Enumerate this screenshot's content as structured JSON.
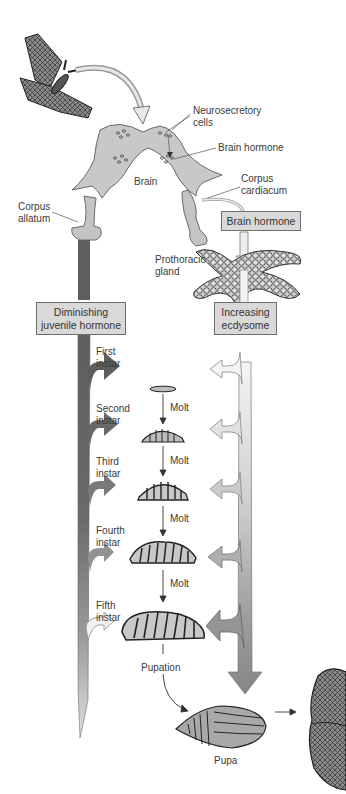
{
  "diagram": {
    "labels": {
      "neurosecretory_cells": "Neurosecretory\ncells",
      "brain_hormone": "Brain hormone",
      "brain": "Brain",
      "corpus_cardiacum": "Corpus\ncardiacum",
      "corpus_allatum": "Corpus\nallatum",
      "prothoracic_gland": "Prothoracic\ngland",
      "pupation": "Pupation",
      "pupa": "Pupa"
    },
    "boxes": {
      "brain_hormone_box": "Brain hormone",
      "juvenile_hormone_box": "Diminishing\njuvenile hormone",
      "ecdysome_box": "Increasing\necdysome"
    },
    "stages": [
      {
        "label": "First\ninstar",
        "molt_label": "Molt"
      },
      {
        "label": "Second\ninstar",
        "molt_label": "Molt"
      },
      {
        "label": "Third\ninstar",
        "molt_label": "Molt"
      },
      {
        "label": "Fourth\ninstar",
        "molt_label": "Molt"
      },
      {
        "label": "Fifth\ninstar"
      }
    ],
    "colors": {
      "juvenile_bar": "#6b6b6b",
      "ecdysome_arrow": "#8c8c8c",
      "box_fill": "#d9d9d9",
      "organ_fill": "#c4c4c4"
    }
  }
}
